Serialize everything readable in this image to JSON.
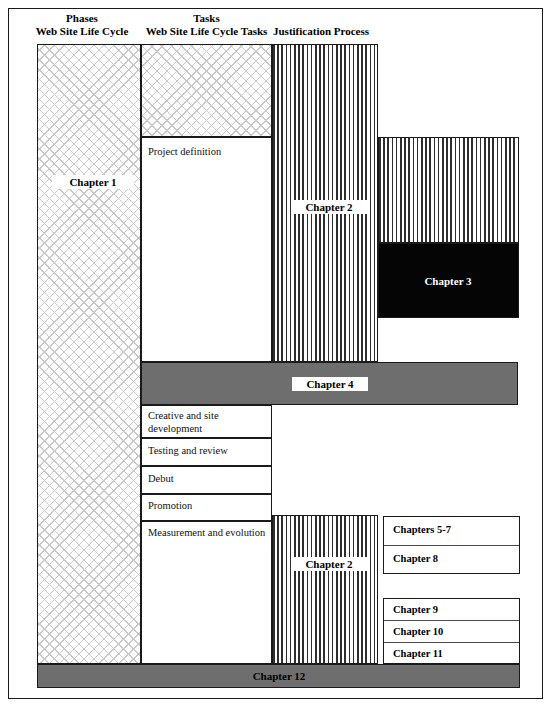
{
  "figure": {
    "type": "block-diagram"
  },
  "columns": [
    {
      "name": "phases",
      "header_line1": "Phases",
      "header_line2": "Web Site Life Cycle"
    },
    {
      "name": "tasks",
      "header_line1": "Tasks",
      "header_line2": "Web Site Life Cycle Tasks"
    },
    {
      "name": "justification",
      "header_line1": "",
      "header_line2": "Justification Process"
    }
  ],
  "phases": {
    "chapter_label": "Chapter 1"
  },
  "tasks": {
    "items": [
      {
        "label": "Project definition"
      },
      {
        "label": "Creative and site development"
      },
      {
        "label": "Testing and review"
      },
      {
        "label": "Debut"
      },
      {
        "label": "Promotion"
      },
      {
        "label": "Measurement and evolution"
      }
    ]
  },
  "justification": {
    "upper_block_label": "Chapter 2",
    "lower_block_label": "Chapter 2"
  },
  "blocks": {
    "chapter3": "Chapter 3",
    "chapter4": "Chapter 4",
    "chapter12": "Chapter 12"
  },
  "right_boxes_upper": [
    {
      "label": "Chapters 5-7"
    },
    {
      "label": "Chapter 8"
    }
  ],
  "right_boxes_lower": [
    {
      "label": "Chapter 9"
    },
    {
      "label": "Chapter 10"
    },
    {
      "label": "Chapter 11"
    }
  ],
  "colors": {
    "grey_bar": "#6e6e6e",
    "black_block": "#050505",
    "hatch_line": "#c9c9c9",
    "stripe": "#2e2e2e",
    "border": "#1a1a1a"
  }
}
